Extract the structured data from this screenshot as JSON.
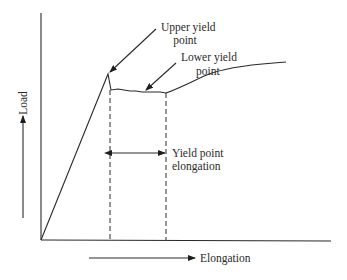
{
  "diagram": {
    "type": "stress-strain load-elongation curve with yield point phenomenon",
    "axes": {
      "y_label": "Load",
      "x_label": "Elongation"
    },
    "annotations": {
      "upper_yield": [
        "Upper yield",
        "point"
      ],
      "lower_yield": [
        "Lower yield",
        "point"
      ],
      "yield_elongation": [
        "Yield point",
        "elongation"
      ]
    },
    "colors": {
      "line": "#2a2a2a",
      "background": "#ffffff"
    }
  }
}
